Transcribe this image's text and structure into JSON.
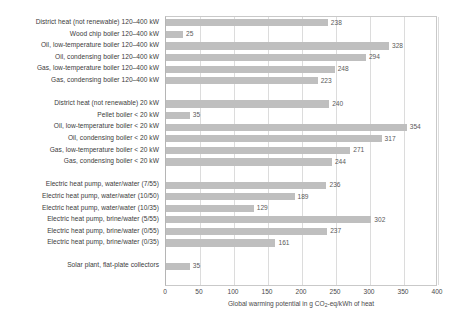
{
  "chart_data": {
    "type": "bar",
    "orientation": "horizontal",
    "title": "",
    "xlabel": "Global warming potential in g CO2-eq/kWh of heat",
    "xlabel_prefix": "Global warming potential in g CO",
    "xlabel_sub": "2",
    "xlabel_suffix": "-eq/kWh of heat",
    "ylabel": "",
    "xlim": [
      0,
      400
    ],
    "xticks": [
      0,
      50,
      100,
      150,
      200,
      250,
      300,
      350,
      400
    ],
    "xtick_labels": [
      "0",
      "50",
      "100",
      "150",
      "200",
      "250",
      "300",
      "350",
      "400"
    ],
    "grid": "vertical",
    "legend": "none",
    "bar_color": "#bfbfbf",
    "categories": [
      "District heat (not renewable) 120–400 kW",
      "Wood chip boiler 120–400 kW",
      "Oil, low-temperature boiler 120–400 kW",
      "Oil, condensing boiler 120–400 kW",
      "Gas, low-temperature boiler 120–400 kW",
      "Gas, condensing boiler 120–400 kW",
      "",
      "District heat (not renewable) 20 kW",
      "Pellet boiler < 20 kW",
      "Oil, low-temperature boiler < 20 kW",
      "Oil, condensing boiler < 20 kW",
      "Gas, low-temperature boiler < 20 kW",
      "Gas, condensing boiler < 20 kW",
      "",
      "Electric heat pump, water/water (7/55)",
      "Electric heat pump, water/water (10/50)",
      "Electric heat pump, water/water (10/35)",
      "Electric heat pump, brine/water (5/55)",
      "Electric heat pump, brine/water (0/55)",
      "Electric heat pump, brine/water (0/35)",
      "",
      "Solar plant, flat-plate collectors"
    ],
    "values": [
      238,
      25,
      328,
      294,
      248,
      223,
      null,
      240,
      35,
      354,
      317,
      271,
      244,
      null,
      236,
      189,
      129,
      302,
      237,
      161,
      null,
      35
    ],
    "value_labels": [
      "238",
      "25",
      "328",
      "294",
      "248",
      "223",
      "",
      "240",
      "35",
      "354",
      "317",
      "271",
      "244",
      "",
      "236",
      "189",
      "129",
      "302",
      "237",
      "161",
      "",
      "35"
    ]
  }
}
